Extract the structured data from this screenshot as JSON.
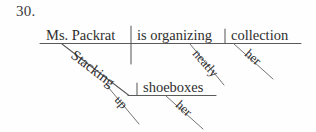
{
  "page": {
    "item_number": "30.",
    "width": 316,
    "height": 132,
    "background_color": "#fefefe",
    "ink_color": "#2e2e2e",
    "line_color": "#5a5a5a"
  },
  "sentence": {
    "text": "Ms. Packrat is organizing her collection, stacking up her shoeboxes neatly."
  },
  "diagram": {
    "type": "sentence-diagram",
    "main_clause": {
      "subject": "Ms. Packrat",
      "verb": "is organizing",
      "direct_object": "collection",
      "object_modifier": "her",
      "verb_modifier": "neatly"
    },
    "participial_phrase": {
      "participle": "Stacking",
      "particle": "up",
      "object": "shoeboxes",
      "object_modifier": "her"
    }
  },
  "labels": {
    "subject": "Ms. Packrat",
    "verb": "is organizing",
    "direct_object": "collection",
    "object_possessive": "her",
    "adverb": "neatly",
    "participle": "Stacking",
    "particle": "up",
    "participle_object": "shoeboxes",
    "participle_object_possessive": "her"
  }
}
